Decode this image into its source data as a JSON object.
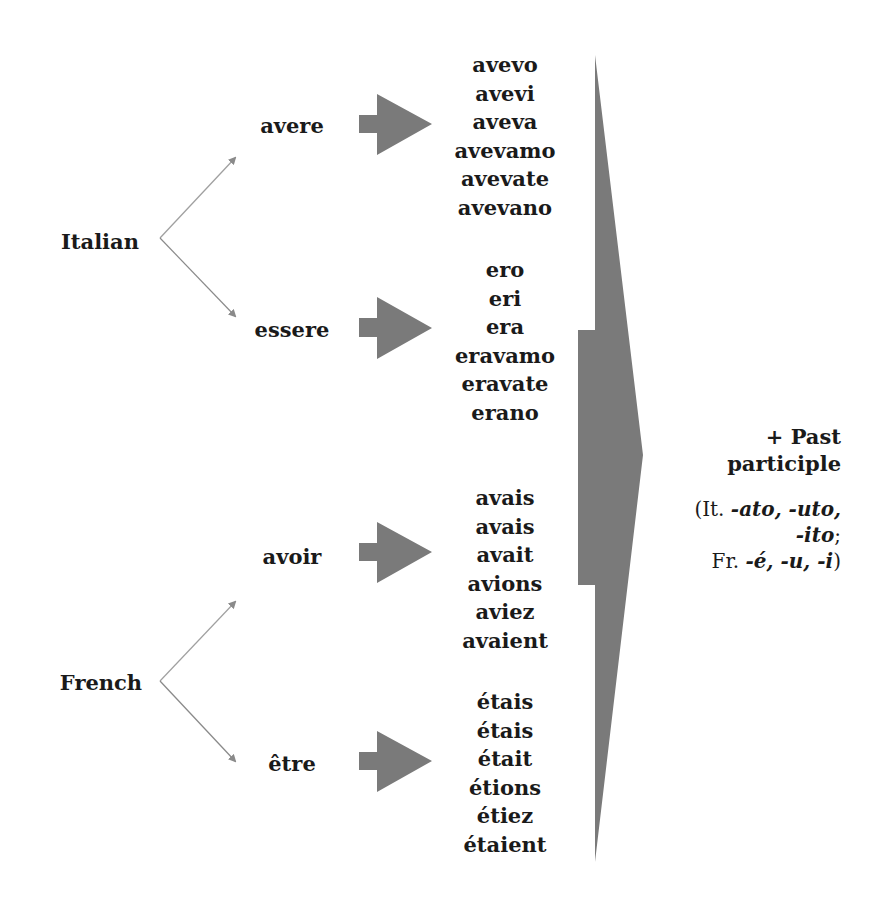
{
  "diagram": {
    "languages": [
      {
        "name": "Italian",
        "auxiliaries": [
          {
            "verb": "avere",
            "forms": [
              "avevo",
              "avevi",
              "aveva",
              "avevamo",
              "avevate",
              "avevano"
            ]
          },
          {
            "verb": "essere",
            "forms": [
              "ero",
              "eri",
              "era",
              "eravamo",
              "eravate",
              "erano"
            ]
          }
        ]
      },
      {
        "name": "French",
        "auxiliaries": [
          {
            "verb": "avoir",
            "forms": [
              "avais",
              "avais",
              "avait",
              "avions",
              "aviez",
              "avaient"
            ]
          },
          {
            "verb": "être",
            "forms": [
              "étais",
              "étais",
              "était",
              "étions",
              "étiez",
              "étaient"
            ]
          }
        ]
      }
    ],
    "result": {
      "line1": "+ Past",
      "line2": "participle",
      "note": {
        "it_prefix": "(It. ",
        "it_suffix_1": "-ato, -uto,",
        "it_suffix_2": "-ito",
        "it_end": ";",
        "fr_prefix": "Fr. ",
        "fr_suffixes": "-é, -u, -i",
        "fr_end": ")"
      }
    },
    "colors": {
      "text": "#1a1a1a",
      "block_arrow": "#7a7a7a",
      "connector_line": "#9a9a9a",
      "background": "#ffffff"
    }
  }
}
